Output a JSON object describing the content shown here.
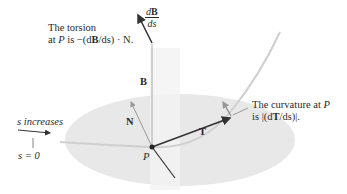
{
  "figure": {
    "torsion_label": {
      "line1": "The torsion",
      "line2_prefix": "at ",
      "point": "P",
      "line2_suffix": " is −(d",
      "vec": "B",
      "line2_end": "/ds) · N."
    },
    "dBds": {
      "num_d": "d",
      "num_vec": "B",
      "den": "ds"
    },
    "B_label": "B",
    "N_label": "N",
    "T_label": "T",
    "P_label": "P",
    "curvature_label": {
      "line1_text": "The curvature at ",
      "line1_point": "P",
      "line2_prefix": "is |(d",
      "line2_vec": "T",
      "line2_suffix": "/ds)|."
    },
    "s_increases": "s increases",
    "s_zero": "s = 0",
    "colors": {
      "plane": "#e6e6e6",
      "vector": "#333333",
      "curve": "#c8c8c8",
      "text": "#2a2a2a"
    }
  }
}
